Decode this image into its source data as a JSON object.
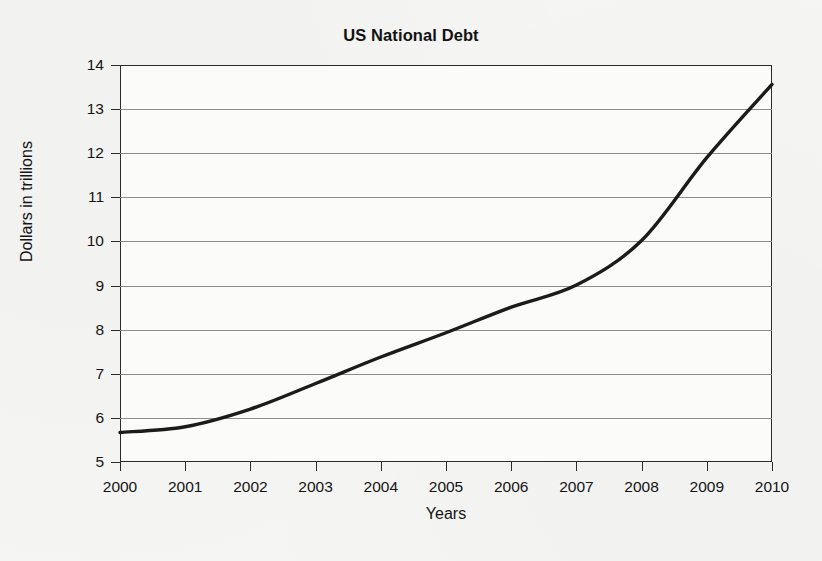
{
  "chart_data": {
    "type": "line",
    "title": "US National Debt",
    "xlabel": "Years",
    "ylabel": "Dollars in trillions",
    "x": [
      2000,
      2001,
      2002,
      2003,
      2004,
      2005,
      2006,
      2007,
      2008,
      2009,
      2010
    ],
    "values": [
      5.67,
      5.8,
      6.2,
      6.78,
      7.38,
      7.93,
      8.51,
      9.01,
      10.02,
      11.9,
      13.56
    ],
    "series": [
      {
        "name": "US National Debt",
        "values": [
          5.67,
          5.8,
          6.2,
          6.78,
          7.38,
          7.93,
          8.51,
          9.01,
          10.02,
          11.9,
          13.56
        ]
      }
    ],
    "xlim": [
      2000,
      2010
    ],
    "ylim": [
      5,
      14
    ],
    "ytick_labels": [
      "14",
      "13",
      "12",
      "11",
      "10",
      "9",
      "8",
      "7",
      "6",
      "5"
    ],
    "yticks": [
      14,
      13,
      12,
      11,
      10,
      9,
      8,
      7,
      6,
      5
    ],
    "xtick_labels": [
      "2000",
      "2001",
      "2002",
      "2003",
      "2004",
      "2005",
      "2006",
      "2007",
      "2008",
      "2009",
      "2010"
    ],
    "grid": "horizontal",
    "legend": "none",
    "line_color": "#1b1b1b",
    "line_width": 3.4,
    "markers": "none",
    "background_color": "#f5f5f3",
    "gridline_color": "#8d8d8d",
    "axis_color": "#2b2b2b"
  }
}
